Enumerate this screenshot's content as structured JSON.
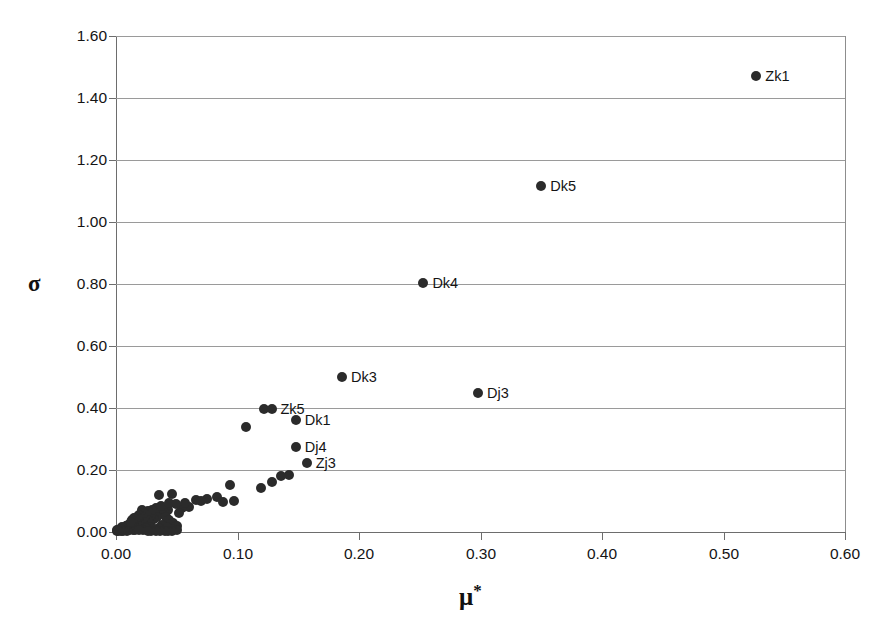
{
  "chart_data": {
    "type": "scatter",
    "title": "",
    "xlabel": "μ*",
    "ylabel": "σ",
    "xlim": [
      0.0,
      0.6
    ],
    "ylim": [
      0.0,
      1.6
    ],
    "xticks": [
      "0.00",
      "0.10",
      "0.20",
      "0.30",
      "0.40",
      "0.50",
      "0.60"
    ],
    "xtick_values": [
      0.0,
      0.1,
      0.2,
      0.3,
      0.4,
      0.5,
      0.6
    ],
    "yticks": [
      "0.00",
      "0.20",
      "0.40",
      "0.60",
      "0.80",
      "1.00",
      "1.20",
      "1.40",
      "1.60"
    ],
    "ytick_values": [
      0.0,
      0.2,
      0.4,
      0.6,
      0.8,
      1.0,
      1.2,
      1.4,
      1.6
    ],
    "grid": "horizontal",
    "legend": "none",
    "marker_color": "#2b2b2b",
    "grid_color": "#9a9a9a",
    "axis_color": "#6d6d6d",
    "background_color": "#ffffff",
    "labeled_points": [
      {
        "label": "Zk1",
        "x": 0.527,
        "y": 1.47
      },
      {
        "label": "Dk5",
        "x": 0.35,
        "y": 1.115
      },
      {
        "label": "Dk4",
        "x": 0.253,
        "y": 0.803
      },
      {
        "label": "Dk3",
        "x": 0.186,
        "y": 0.5
      },
      {
        "label": "Dj3",
        "x": 0.298,
        "y": 0.447
      },
      {
        "label": "Zk5",
        "x": 0.128,
        "y": 0.398
      },
      {
        "label": "Dk1",
        "x": 0.148,
        "y": 0.36
      },
      {
        "label": "Dj4",
        "x": 0.148,
        "y": 0.275
      },
      {
        "label": "Zj3",
        "x": 0.157,
        "y": 0.222
      }
    ],
    "unlabeled_points": [
      {
        "x": 0.107,
        "y": 0.34
      },
      {
        "x": 0.122,
        "y": 0.398
      },
      {
        "x": 0.119,
        "y": 0.142
      },
      {
        "x": 0.128,
        "y": 0.162
      },
      {
        "x": 0.136,
        "y": 0.181
      },
      {
        "x": 0.142,
        "y": 0.185
      },
      {
        "x": 0.094,
        "y": 0.152
      },
      {
        "x": 0.083,
        "y": 0.112
      },
      {
        "x": 0.075,
        "y": 0.108
      },
      {
        "x": 0.066,
        "y": 0.104
      },
      {
        "x": 0.06,
        "y": 0.082
      },
      {
        "x": 0.054,
        "y": 0.078
      },
      {
        "x": 0.049,
        "y": 0.09
      },
      {
        "x": 0.046,
        "y": 0.122
      },
      {
        "x": 0.043,
        "y": 0.07
      },
      {
        "x": 0.04,
        "y": 0.062
      },
      {
        "x": 0.038,
        "y": 0.058
      },
      {
        "x": 0.036,
        "y": 0.065
      },
      {
        "x": 0.034,
        "y": 0.05
      },
      {
        "x": 0.032,
        "y": 0.055
      },
      {
        "x": 0.031,
        "y": 0.042
      },
      {
        "x": 0.03,
        "y": 0.06
      },
      {
        "x": 0.029,
        "y": 0.036
      },
      {
        "x": 0.028,
        "y": 0.048
      },
      {
        "x": 0.027,
        "y": 0.028
      },
      {
        "x": 0.026,
        "y": 0.04
      },
      {
        "x": 0.025,
        "y": 0.056
      },
      {
        "x": 0.024,
        "y": 0.032
      },
      {
        "x": 0.023,
        "y": 0.044
      },
      {
        "x": 0.022,
        "y": 0.024
      },
      {
        "x": 0.021,
        "y": 0.038
      },
      {
        "x": 0.02,
        "y": 0.052
      },
      {
        "x": 0.02,
        "y": 0.018
      },
      {
        "x": 0.019,
        "y": 0.03
      },
      {
        "x": 0.018,
        "y": 0.043
      },
      {
        "x": 0.018,
        "y": 0.012
      },
      {
        "x": 0.017,
        "y": 0.026
      },
      {
        "x": 0.016,
        "y": 0.036
      },
      {
        "x": 0.016,
        "y": 0.008
      },
      {
        "x": 0.015,
        "y": 0.02
      },
      {
        "x": 0.014,
        "y": 0.031
      },
      {
        "x": 0.014,
        "y": 0.006
      },
      {
        "x": 0.013,
        "y": 0.016
      },
      {
        "x": 0.013,
        "y": 0.026
      },
      {
        "x": 0.012,
        "y": 0.01
      },
      {
        "x": 0.012,
        "y": 0.021
      },
      {
        "x": 0.011,
        "y": 0.005
      },
      {
        "x": 0.011,
        "y": 0.015
      },
      {
        "x": 0.01,
        "y": 0.024
      },
      {
        "x": 0.01,
        "y": 0.008
      },
      {
        "x": 0.009,
        "y": 0.018
      },
      {
        "x": 0.009,
        "y": 0.004
      },
      {
        "x": 0.008,
        "y": 0.012
      },
      {
        "x": 0.008,
        "y": 0.02
      },
      {
        "x": 0.007,
        "y": 0.006
      },
      {
        "x": 0.007,
        "y": 0.014
      },
      {
        "x": 0.006,
        "y": 0.003
      },
      {
        "x": 0.006,
        "y": 0.01
      },
      {
        "x": 0.005,
        "y": 0.016
      },
      {
        "x": 0.005,
        "y": 0.005
      },
      {
        "x": 0.004,
        "y": 0.009
      },
      {
        "x": 0.004,
        "y": 0.002
      },
      {
        "x": 0.003,
        "y": 0.006
      },
      {
        "x": 0.003,
        "y": 0.011
      },
      {
        "x": 0.002,
        "y": 0.003
      },
      {
        "x": 0.002,
        "y": 0.007
      },
      {
        "x": 0.001,
        "y": 0.002
      },
      {
        "x": 0.001,
        "y": 0.005
      },
      {
        "x": 0.033,
        "y": 0.078
      },
      {
        "x": 0.037,
        "y": 0.085
      },
      {
        "x": 0.041,
        "y": 0.048
      },
      {
        "x": 0.044,
        "y": 0.038
      },
      {
        "x": 0.047,
        "y": 0.028
      },
      {
        "x": 0.05,
        "y": 0.02
      },
      {
        "x": 0.05,
        "y": 0.006
      },
      {
        "x": 0.046,
        "y": 0.01
      },
      {
        "x": 0.042,
        "y": 0.016
      },
      {
        "x": 0.038,
        "y": 0.022
      },
      {
        "x": 0.035,
        "y": 0.014
      },
      {
        "x": 0.031,
        "y": 0.009
      },
      {
        "x": 0.028,
        "y": 0.016
      },
      {
        "x": 0.025,
        "y": 0.012
      },
      {
        "x": 0.022,
        "y": 0.008
      },
      {
        "x": 0.019,
        "y": 0.006
      },
      {
        "x": 0.035,
        "y": 0.12
      },
      {
        "x": 0.03,
        "y": 0.072
      },
      {
        "x": 0.026,
        "y": 0.068
      },
      {
        "x": 0.023,
        "y": 0.062
      },
      {
        "x": 0.021,
        "y": 0.07
      },
      {
        "x": 0.019,
        "y": 0.056
      },
      {
        "x": 0.017,
        "y": 0.05
      },
      {
        "x": 0.015,
        "y": 0.044
      },
      {
        "x": 0.013,
        "y": 0.038
      },
      {
        "x": 0.012,
        "y": 0.033
      },
      {
        "x": 0.046,
        "y": 0.002
      },
      {
        "x": 0.043,
        "y": 0.004
      },
      {
        "x": 0.04,
        "y": 0.003
      },
      {
        "x": 0.036,
        "y": 0.004
      },
      {
        "x": 0.033,
        "y": 0.003
      },
      {
        "x": 0.029,
        "y": 0.002
      },
      {
        "x": 0.026,
        "y": 0.003
      },
      {
        "x": 0.097,
        "y": 0.1
      },
      {
        "x": 0.088,
        "y": 0.096
      },
      {
        "x": 0.07,
        "y": 0.1
      },
      {
        "x": 0.057,
        "y": 0.095
      },
      {
        "x": 0.052,
        "y": 0.062
      },
      {
        "x": 0.044,
        "y": 0.094
      }
    ]
  }
}
